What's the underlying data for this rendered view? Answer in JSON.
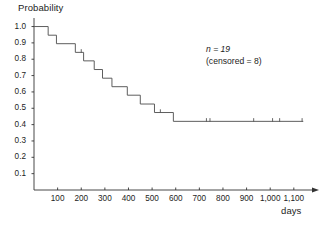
{
  "figure": {
    "ylabel": "Probability",
    "xlabel": "days",
    "annotation_n": "n = 19",
    "annotation_censored": "(censored = 8)",
    "line_color": "#555555",
    "axis_color": "#333333",
    "background": "#ffffff"
  },
  "chart_data": {
    "type": "line",
    "subtype": "kaplan-meier-step",
    "title": "",
    "xlabel": "days",
    "ylabel": "Probability",
    "xlim": [
      0,
      1160
    ],
    "ylim": [
      0,
      1.04
    ],
    "grid": false,
    "legend": null,
    "annotations": [
      "n = 19",
      "(censored = 8)"
    ],
    "xticks": [
      100,
      200,
      300,
      400,
      500,
      600,
      700,
      800,
      900,
      1000,
      1100
    ],
    "xticklabels": [
      "100",
      "200",
      "300",
      "400",
      "500",
      "600",
      "700",
      "800",
      "900",
      "1,000",
      "1,100"
    ],
    "yticks": [
      0.1,
      0.2,
      0.3,
      0.4,
      0.5,
      0.6,
      0.7,
      0.8,
      0.9,
      1.0
    ],
    "yticklabels": [
      "0.1",
      "0.2",
      "0.3",
      "0.4",
      "0.5",
      "0.6",
      "0.7",
      "0.8",
      "0.9",
      "1.0"
    ],
    "n": 19,
    "censored": 8,
    "series": [
      {
        "name": "survival",
        "x": [
          0,
          60,
          60,
          95,
          95,
          175,
          175,
          210,
          210,
          255,
          255,
          290,
          290,
          330,
          330,
          395,
          395,
          450,
          450,
          510,
          510,
          590,
          590,
          1140
        ],
        "y": [
          1.0,
          1.0,
          0.947,
          0.947,
          0.895,
          0.895,
          0.842,
          0.842,
          0.79,
          0.79,
          0.737,
          0.737,
          0.684,
          0.684,
          0.632,
          0.632,
          0.58,
          0.58,
          0.526,
          0.526,
          0.474,
          0.474,
          0.42,
          0.42
        ],
        "steps": [
          {
            "day": 0,
            "prob": 1.0
          },
          {
            "day": 60,
            "prob": 0.947
          },
          {
            "day": 95,
            "prob": 0.895
          },
          {
            "day": 175,
            "prob": 0.842
          },
          {
            "day": 210,
            "prob": 0.79
          },
          {
            "day": 255,
            "prob": 0.737
          },
          {
            "day": 290,
            "prob": 0.684
          },
          {
            "day": 330,
            "prob": 0.632
          },
          {
            "day": 395,
            "prob": 0.58
          },
          {
            "day": 450,
            "prob": 0.526
          },
          {
            "day": 510,
            "prob": 0.474
          },
          {
            "day": 590,
            "prob": 0.42
          }
        ]
      }
    ],
    "censor_marks": [
      {
        "day": 200,
        "prob": 0.842
      },
      {
        "day": 535,
        "prob": 0.474
      },
      {
        "day": 730,
        "prob": 0.42
      },
      {
        "day": 745,
        "prob": 0.42
      },
      {
        "day": 930,
        "prob": 0.42
      },
      {
        "day": 1010,
        "prob": 0.42
      },
      {
        "day": 1040,
        "prob": 0.42
      },
      {
        "day": 1135,
        "prob": 0.42
      }
    ]
  }
}
